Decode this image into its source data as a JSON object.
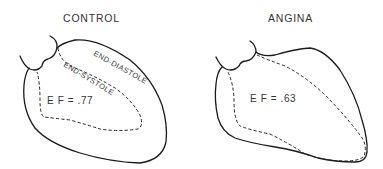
{
  "figure": {
    "panels": [
      {
        "title": "CONTROL",
        "ef_label": "E F = .77",
        "contour_labels": {
          "outer": "END-DIASTOLE",
          "inner": "END-SYSTOLE"
        }
      },
      {
        "title": "ANGINA",
        "ef_label": "E F = .63"
      }
    ],
    "legend": {
      "solid_line": "END-DIASTOLE",
      "dashed_line": "END-SYSTOLE"
    },
    "colors": {
      "line": "#1a1a1a",
      "text": "#333333",
      "background": "#ffffff"
    }
  }
}
